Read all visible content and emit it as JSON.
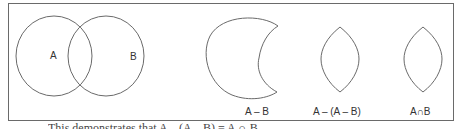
{
  "diagram": {
    "venn": {
      "set_a_label": "A",
      "set_b_label": "B"
    },
    "panels": [
      {
        "shape": "crescent",
        "label": "A – B"
      },
      {
        "shape": "lens",
        "label": "A – (A – B)"
      },
      {
        "shape": "lens",
        "label": "A∩B"
      }
    ],
    "caption_partial": "This demonstrates that A – (A – B) = A ∩ B",
    "colors": {
      "stroke": "#6a6a6a",
      "text": "#333333",
      "background": "#ffffff"
    }
  }
}
